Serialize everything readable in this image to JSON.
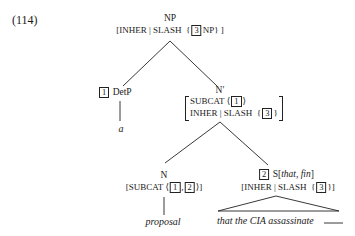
{
  "example_number": "(114)",
  "root": {
    "category": "NP",
    "avm": {
      "open": "[",
      "feature": "INHER | SLASH",
      "set_open": "{",
      "tag": "3",
      "value": "NP}",
      "close": "]"
    }
  },
  "det": {
    "tag": "1",
    "category": "DetP",
    "word": "a"
  },
  "nbar": {
    "category": "N′",
    "row1": {
      "feature": "SUBCAT",
      "open": "⟨",
      "tag": "1",
      "close": "⟩"
    },
    "row2": {
      "feature": "INHER | SLASH",
      "open": "{",
      "tag": "3",
      "close": "}"
    }
  },
  "noun": {
    "category": "N",
    "avm": {
      "open": "[SUBCAT",
      "list_open": "⟨",
      "tag1": "1",
      "sep": ",",
      "tag2": "2",
      "close": "⟩]"
    },
    "word": "proposal"
  },
  "clause": {
    "tag": "2",
    "category": "S",
    "features_open": "[",
    "features": "that, fin",
    "features_close": "]",
    "avm": {
      "open": "[INHER | SLASH",
      "set_open": "{",
      "tag": "3",
      "close": "}]"
    },
    "words": "that the CIA assassinate",
    "gap": "____"
  }
}
